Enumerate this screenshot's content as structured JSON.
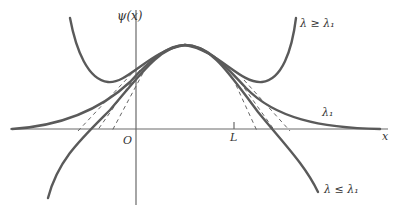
{
  "diagram": {
    "axes": {
      "y_label": "ψ(x)",
      "x_label": "x",
      "origin_label": "O",
      "tick_label": "L"
    },
    "curves": [
      {
        "id": "above",
        "label": "λ ≥ λ₁",
        "description": "curve bends back upward on both sides (diverges to +∞)"
      },
      {
        "id": "critical",
        "label": "λ₁",
        "description": "curve decays asymptotically to x-axis on both sides"
      },
      {
        "id": "below",
        "label": "λ ≤ λ₁",
        "description": "curve crosses axis and diverges to −∞ on both sides"
      }
    ],
    "labels": {
      "upper_right": "λ ≥ λ₁",
      "middle_right": "λ₁",
      "lower_right": "λ ≤ λ₁"
    },
    "colors": {
      "curve": "#5a5a5a",
      "axis": "#6a6a6a",
      "text": "#333333"
    }
  }
}
